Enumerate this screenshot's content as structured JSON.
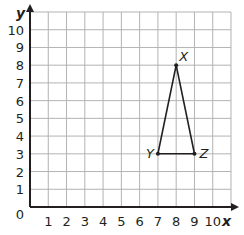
{
  "chart_data": {
    "type": "scatter",
    "title": "",
    "xlabel": "x",
    "ylabel": "y",
    "xlim": [
      0,
      11
    ],
    "ylim": [
      0,
      11
    ],
    "grid": true,
    "x_ticks": [
      "1",
      "2",
      "3",
      "4",
      "5",
      "6",
      "7",
      "8",
      "9",
      "10"
    ],
    "y_ticks": [
      "1",
      "2",
      "3",
      "4",
      "5",
      "6",
      "7",
      "8",
      "9",
      "10"
    ],
    "origin_label": "0",
    "points": [
      {
        "label": "X",
        "x": 8,
        "y": 8
      },
      {
        "label": "Y",
        "x": 7,
        "y": 3
      },
      {
        "label": "Z",
        "x": 9,
        "y": 3
      }
    ],
    "shape": {
      "type": "triangle",
      "vertices": [
        "X",
        "Y",
        "Z"
      ]
    },
    "colors": {
      "grid": "#b3b3b3",
      "axis": "#231f20",
      "shape": "#231f20"
    }
  }
}
